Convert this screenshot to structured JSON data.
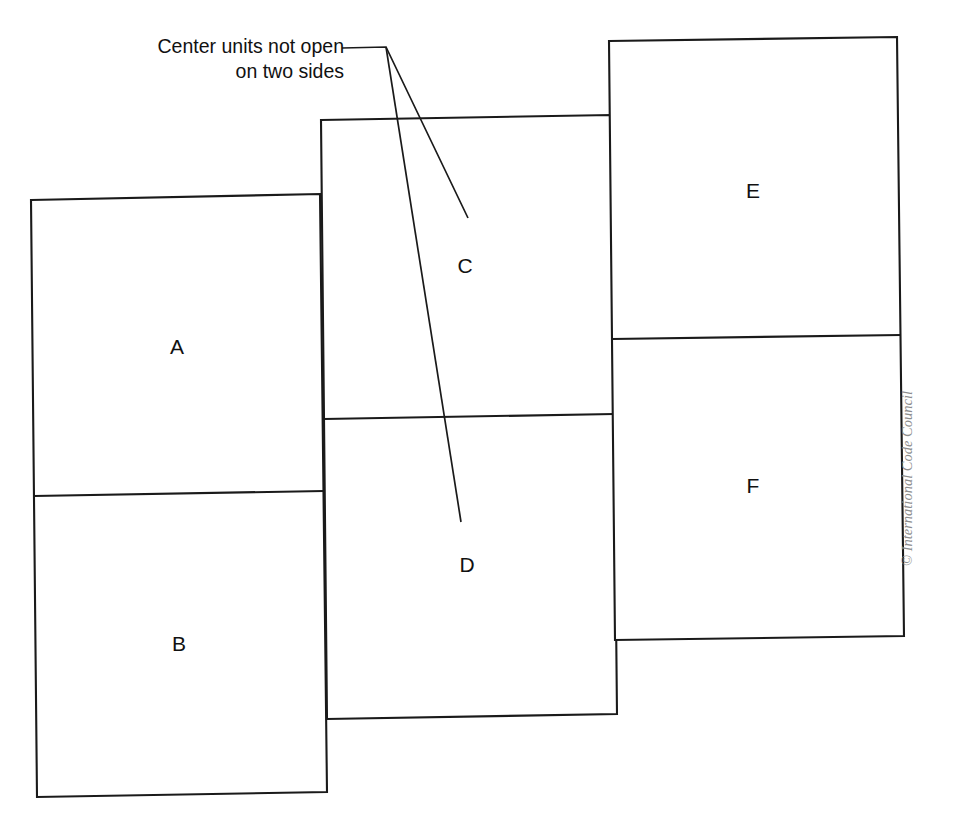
{
  "diagram": {
    "title": "Center units not open on two sides",
    "callout": {
      "line1": "Center units not open",
      "line2": "on two sides",
      "full_text": "Center units not open on two sides"
    },
    "units": [
      {
        "id": "A",
        "label": "A",
        "column": "left",
        "position": "top",
        "label_x": 177,
        "label_y": 348
      },
      {
        "id": "B",
        "label": "B",
        "column": "left",
        "position": "bottom",
        "label_x": 179,
        "label_y": 645
      },
      {
        "id": "C",
        "label": "C",
        "column": "center",
        "position": "top",
        "label_x": 465,
        "label_y": 267
      },
      {
        "id": "D",
        "label": "D",
        "column": "center",
        "position": "bottom",
        "label_x": 467,
        "label_y": 566
      },
      {
        "id": "E",
        "label": "E",
        "column": "right",
        "position": "top",
        "label_x": 753,
        "label_y": 192
      },
      {
        "id": "F",
        "label": "F",
        "column": "right",
        "position": "bottom",
        "label_x": 753,
        "label_y": 487
      }
    ],
    "columns": [
      {
        "name": "left",
        "outline": "31,200 320,194 327,792 37,797",
        "divider": "34,496 324,491"
      },
      {
        "name": "center",
        "outline": "321,120 611,115 617,714 327,719",
        "divider": "324,419 614,414"
      },
      {
        "name": "right",
        "outline": "609,41 897,37 904,636 615,640",
        "divider": "612,339 901,335"
      }
    ],
    "leaders": [
      {
        "target": "C",
        "path": "342,48 386,47 468,218"
      },
      {
        "target": "D",
        "path": "386,47 461,522"
      }
    ],
    "copyright": "© International Code Council",
    "colors": {
      "background": "#ffffff",
      "stroke": "#1a1a1a",
      "text": "#111111",
      "copyright_text": "#8d8d8d"
    }
  }
}
